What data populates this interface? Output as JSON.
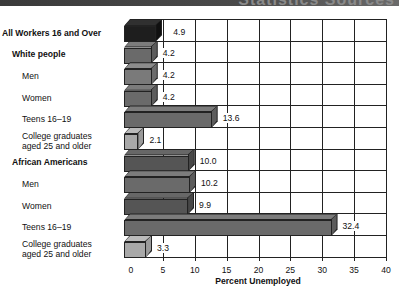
{
  "header": {
    "title_fragment": "Statistics Sources"
  },
  "chart_data": {
    "type": "bar",
    "orientation": "horizontal",
    "style": "3d",
    "title": "",
    "xlabel": "Percent Unemployed",
    "ylabel": "",
    "xlim": [
      0,
      40
    ],
    "xticks": [
      0,
      5,
      10,
      15,
      20,
      25,
      30,
      35,
      40
    ],
    "grid": true,
    "categories": [
      "All Workers 16 and Over",
      "White people",
      "Men",
      "Women",
      "Teens 16–19",
      "College graduates aged 25 and older",
      "African Americans",
      "Men",
      "Women",
      "Teens 16–19",
      "College graduates aged 25 and older"
    ],
    "values": [
      4.9,
      4.2,
      4.2,
      4.2,
      13.6,
      2.1,
      10.0,
      10.2,
      9.9,
      32.4,
      3.3
    ],
    "value_labels": [
      "4.9",
      "4.2",
      "4.2",
      "4.2",
      "13.6",
      "2.1",
      "10.0",
      "10.2",
      "9.9",
      "32.4",
      "3.3"
    ],
    "groups": [
      {
        "name": "All Workers 16 and Over",
        "rows": [
          0
        ]
      },
      {
        "name": "White people",
        "rows": [
          1,
          2,
          3,
          4,
          5
        ]
      },
      {
        "name": "African Americans",
        "rows": [
          6,
          7,
          8,
          9,
          10
        ]
      }
    ],
    "bar_colors": [
      "#1e1e1e",
      "#6a6a6a",
      "#7a7a7a",
      "#6a6a6a",
      "#6a6a6a",
      "#a8a8a8",
      "#555555",
      "#6a6a6a",
      "#555555",
      "#6a6a6a",
      "#a8a8a8"
    ]
  },
  "rows": [
    {
      "label_line1": "All Workers 16 and Over",
      "label_line2": "",
      "bold": true,
      "indent": 0,
      "value": "4.9"
    },
    {
      "label_line1": "White people",
      "label_line2": "",
      "bold": true,
      "indent": 1,
      "value": "4.2"
    },
    {
      "label_line1": "Men",
      "label_line2": "",
      "bold": false,
      "indent": 2,
      "value": "4.2"
    },
    {
      "label_line1": "Women",
      "label_line2": "",
      "bold": false,
      "indent": 2,
      "value": "4.2"
    },
    {
      "label_line1": "Teens 16–19",
      "label_line2": "",
      "bold": false,
      "indent": 2,
      "value": "13.6"
    },
    {
      "label_line1": "College graduates",
      "label_line2": "aged 25 and older",
      "bold": false,
      "indent": 2,
      "value": "2.1"
    },
    {
      "label_line1": "African Americans",
      "label_line2": "",
      "bold": true,
      "indent": 1,
      "value": "10.0"
    },
    {
      "label_line1": "Men",
      "label_line2": "",
      "bold": false,
      "indent": 2,
      "value": "10.2"
    },
    {
      "label_line1": "Women",
      "label_line2": "",
      "bold": false,
      "indent": 2,
      "value": "9.9"
    },
    {
      "label_line1": "Teens 16–19",
      "label_line2": "",
      "bold": false,
      "indent": 2,
      "value": "32.4"
    },
    {
      "label_line1": "College graduates",
      "label_line2": "aged 25 and older",
      "bold": false,
      "indent": 2,
      "value": "3.3"
    }
  ],
  "axis": {
    "ticks": [
      "0",
      "5",
      "10",
      "15",
      "20",
      "25",
      "30",
      "35",
      "40"
    ],
    "label": "Percent Unemployed"
  }
}
